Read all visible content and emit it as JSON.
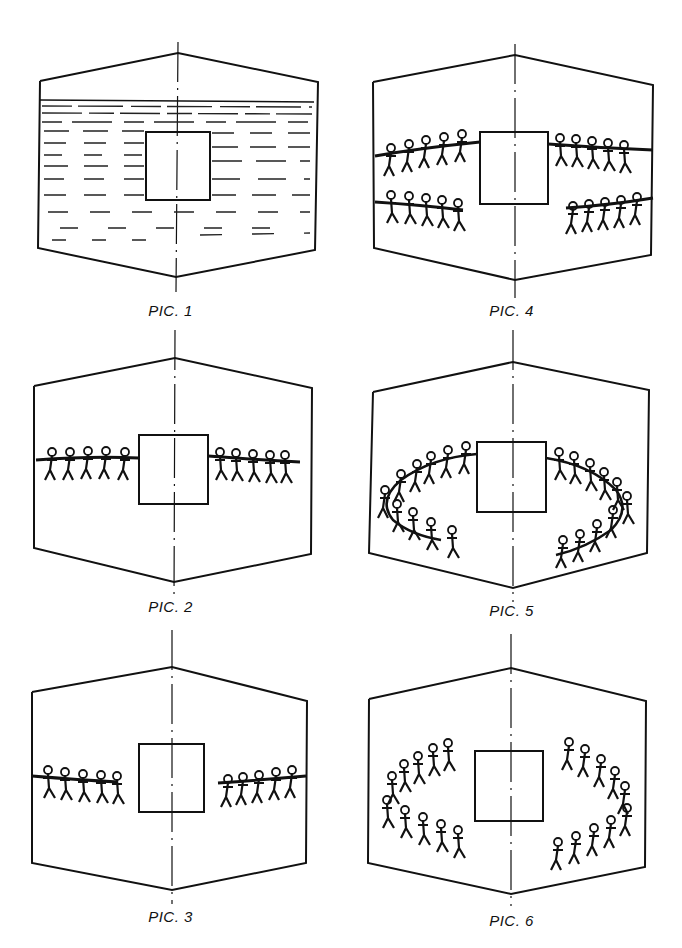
{
  "figure": {
    "panels": [
      {
        "id": 1,
        "caption": "PIC. 1",
        "content": "wall filled with horizontal dashed hatching, square in center"
      },
      {
        "id": 2,
        "caption": "PIC. 2",
        "content": "two rows of 5 figures pulling ropes on left and right of square"
      },
      {
        "id": 3,
        "caption": "PIC. 3",
        "content": "two groups of 5 figures pulling away from square"
      },
      {
        "id": 4,
        "caption": "PIC. 4",
        "content": "four groups of 5 figures pulling ropes"
      },
      {
        "id": 5,
        "caption": "PIC. 5",
        "content": "figures arranged in ellipse around square holding ropes"
      },
      {
        "id": 6,
        "caption": "PIC. 6",
        "content": "figures arranged in ellipse around square without ropes"
      }
    ]
  }
}
